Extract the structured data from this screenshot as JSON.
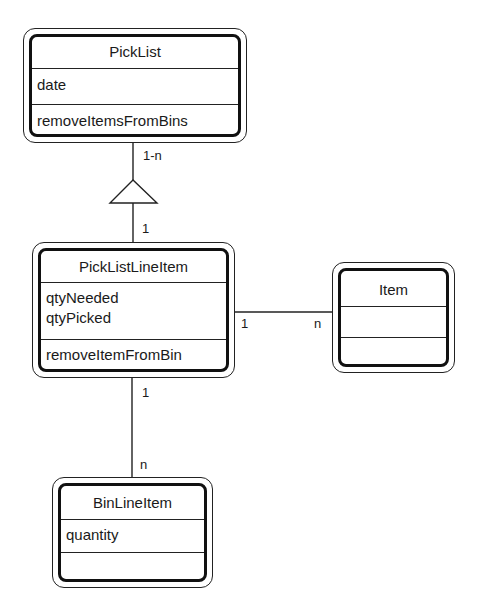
{
  "diagram": {
    "type": "UML class diagram",
    "classes": {
      "picklist": {
        "name": "PickList",
        "attributes": [
          "date"
        ],
        "operations": [
          "removeItemsFromBins"
        ]
      },
      "picklistlineitem": {
        "name": "PickListLineItem",
        "attributes": [
          "qtyNeeded",
          "qtyPicked"
        ],
        "operations": [
          "removeItemFromBin"
        ]
      },
      "item": {
        "name": "Item",
        "attributes": [],
        "operations": []
      },
      "binlineitem": {
        "name": "BinLineItem",
        "attributes": [
          "quantity"
        ],
        "operations": []
      }
    },
    "relationships": [
      {
        "from": "PickList",
        "to": "PickListLineItem",
        "kind": "aggregation-triangle",
        "from_mult": "1-n",
        "to_mult": "1"
      },
      {
        "from": "PickListLineItem",
        "to": "Item",
        "kind": "association",
        "from_mult": "1",
        "to_mult": "n"
      },
      {
        "from": "PickListLineItem",
        "to": "BinLineItem",
        "kind": "association",
        "from_mult": "1",
        "to_mult": "n"
      }
    ],
    "labels": {
      "picklist_top_mult": "1-n",
      "picklist_bottom_mult": "1",
      "item_left_mult": "1",
      "item_right_mult": "n",
      "bin_top_mult": "1",
      "bin_bottom_mult": "n"
    },
    "colors": {
      "line": "#222222",
      "background": "#ffffff"
    }
  }
}
